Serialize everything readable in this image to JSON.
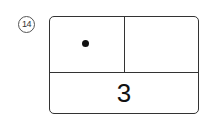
{
  "problem": {
    "number_label": "14",
    "cells": {
      "top_left": {
        "content": "dot"
      },
      "top_right": {
        "content": ""
      },
      "bottom": {
        "value": "3"
      }
    }
  }
}
